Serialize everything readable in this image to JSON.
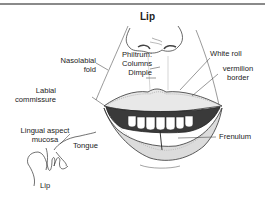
{
  "figure": {
    "title": "Lip",
    "labels": {
      "nasolabial_fold": [
        "Nasolabial",
        "fold"
      ],
      "philtrum": [
        "Philtrum:",
        "Columns",
        "Dimple"
      ],
      "white_roll": "White roll",
      "vermilion_border": [
        "vermilion",
        "border"
      ],
      "labial_commissure": [
        "Labial",
        "commissure"
      ],
      "frenulum": "Frenulum",
      "lingual_aspect_mucosa": [
        "Lingual aspect",
        "mucosa"
      ],
      "tongue": "Tongue",
      "lip_section": "Lip"
    },
    "colors": {
      "line": "#333333",
      "hatch": "#8a8a8a",
      "rule": "#8a8a8a"
    }
  }
}
